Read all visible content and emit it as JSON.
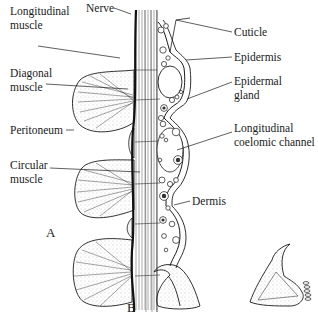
{
  "figure": {
    "panels": [
      {
        "id": "A",
        "label": "A"
      },
      {
        "id": "B",
        "label": "B"
      }
    ],
    "labels_left": {
      "longitudinal_muscle": [
        "Longitudinal",
        "muscle"
      ],
      "diagonal_muscle": [
        "Diagonal",
        "muscle"
      ],
      "peritoneum": "Peritoneum",
      "circular_muscle": [
        "Circular",
        "muscle"
      ]
    },
    "labels_top": {
      "nerve": "Nerve"
    },
    "labels_right": {
      "cuticle": "Cuticle",
      "epidermis": "Epidermis",
      "epidermal_gland": [
        "Epidermal",
        "gland"
      ],
      "longitudinal_coelomic_channel": [
        "Longitudinal",
        "coelomic channel"
      ],
      "dermis": "Dermis"
    },
    "colors": {
      "ink": "#1a1a1a",
      "stipple": "#8a8a8a",
      "background": "#ffffff"
    }
  }
}
